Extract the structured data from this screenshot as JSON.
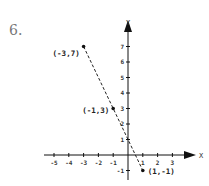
{
  "problem_number": "6.",
  "chart_data": {
    "type": "scatter",
    "title": "",
    "xlabel": "X",
    "ylabel": "Y",
    "xlim": [
      -5.5,
      3.5
    ],
    "ylim": [
      -1.8,
      7.5
    ],
    "x_ticks": [
      -5,
      -4,
      -3,
      -2,
      -1,
      1,
      2,
      3
    ],
    "y_ticks": [
      -1,
      1,
      2,
      3,
      4,
      5,
      6,
      7
    ],
    "grid": false,
    "series": [
      {
        "name": "points",
        "points": [
          {
            "x": -3,
            "y": 7,
            "label": "(-3,7)"
          },
          {
            "x": -1,
            "y": 3,
            "label": "(-1,3)"
          },
          {
            "x": 1,
            "y": -1,
            "label": "(1,-1)"
          }
        ]
      }
    ],
    "line": {
      "style": "dashed",
      "from": [
        -3,
        7
      ],
      "to": [
        1,
        -1
      ],
      "equation": "y = -2x + 1"
    }
  }
}
